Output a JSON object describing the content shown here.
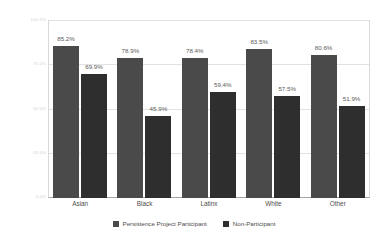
{
  "chart_data": {
    "type": "bar",
    "title": "",
    "subtitle": "",
    "xlabel": "",
    "ylabel": "",
    "categories": [
      "Asian",
      "Black",
      "Latinx",
      "White",
      "Other"
    ],
    "series": [
      {
        "name": "Persistence Project Participant",
        "color": "#4a4a4a",
        "values": [
          85.2,
          78.9,
          78.4,
          83.5,
          80.6
        ],
        "labels": [
          "85.2%",
          "78.9%",
          "78.4%",
          "83.5%",
          "80.6%"
        ]
      },
      {
        "name": "Non-Participant",
        "color": "#2e2e2e",
        "values": [
          69.9,
          45.9,
          59.4,
          57.5,
          51.9
        ],
        "labels": [
          "69.9%",
          "45.9%",
          "59.4%",
          "57.5%",
          "51.9%"
        ]
      }
    ],
    "ylim": [
      0,
      100
    ],
    "yticks": [
      0,
      25,
      50,
      75,
      100
    ],
    "ytick_labels": [
      "0.0%",
      "25.0%",
      "50.0%",
      "75.0%",
      "100.0%"
    ],
    "grid": true,
    "legend_position": "bottom"
  },
  "legend": {
    "entries": [
      {
        "label": "Persistence Project Participant"
      },
      {
        "label": "Non-Participant"
      }
    ]
  },
  "axis": {
    "y_tick_0": "0.0%",
    "y_tick_1": "25.0%",
    "y_tick_2": "50.0%",
    "y_tick_3": "75.0%",
    "y_tick_4": "100.0%"
  },
  "colors": {
    "series_participant": "#4a4a4a",
    "series_nonparticipant": "#2e2e2e",
    "gridline": "#e2e2e2",
    "axis": "#a6a6a6",
    "background": "#ffffff"
  }
}
